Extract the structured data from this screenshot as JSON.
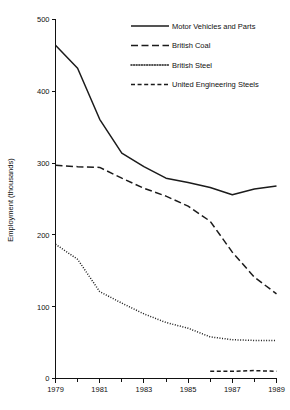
{
  "chart_data": {
    "type": "line",
    "title": "",
    "subtitle": "",
    "xlabel": "",
    "ylabel": "Employment (thousands)",
    "xlim": [
      1979,
      1989
    ],
    "ylim": [
      0,
      500
    ],
    "grid": false,
    "legend_position": "top-center",
    "y_ticks": [
      0,
      100,
      200,
      300,
      400,
      500
    ],
    "y_tick_labels": [
      "0",
      "100",
      "200",
      "300",
      "400",
      "500"
    ],
    "x_ticks": [
      1979,
      1980,
      1981,
      1982,
      1983,
      1984,
      1985,
      1986,
      1987,
      1988,
      1989
    ],
    "x_tick_labels_major": [
      "1979",
      "1981",
      "1983",
      "1985",
      "1987",
      "1989"
    ],
    "x_major_values": [
      1979,
      1981,
      1983,
      1985,
      1987,
      1989
    ],
    "x": [
      1979,
      1980,
      1981,
      1982,
      1983,
      1984,
      1985,
      1986,
      1987,
      1988,
      1989
    ],
    "series": [
      {
        "name": "Motor Vehicles and Parts",
        "style": "solid",
        "x": [
          1979,
          1980,
          1981,
          1982,
          1983,
          1984,
          1985,
          1986,
          1987,
          1988,
          1989
        ],
        "values": [
          464,
          432,
          361,
          314,
          295,
          279,
          273,
          266,
          256,
          264,
          268
        ]
      },
      {
        "name": "British Coal",
        "style": "long-dash",
        "x": [
          1979,
          1980,
          1981,
          1982,
          1983,
          1984,
          1985,
          1986,
          1987,
          1988,
          1989
        ],
        "values": [
          297,
          295,
          294,
          279,
          265,
          254,
          240,
          219,
          176,
          141,
          118
        ]
      },
      {
        "name": "British Steel",
        "style": "dotted",
        "x": [
          1979,
          1980,
          1981,
          1982,
          1983,
          1984,
          1985,
          1986,
          1987,
          1988,
          1989
        ],
        "values": [
          187,
          166,
          121,
          105,
          90,
          78,
          70,
          58,
          54,
          53,
          53
        ]
      },
      {
        "name": "United Engineering Steels",
        "style": "short-dash",
        "x": [
          1986,
          1987,
          1988,
          1989
        ],
        "values": [
          10,
          10,
          11,
          10
        ]
      }
    ]
  },
  "legend": {
    "entries": [
      {
        "label": "Motor Vehicles and Parts",
        "style": "solid"
      },
      {
        "label": "British Coal",
        "style": "long-dash"
      },
      {
        "label": "British Steel",
        "style": "dotted"
      },
      {
        "label": "United Engineering Steels",
        "style": "short-dash"
      }
    ]
  },
  "axes": {
    "y_axis_title": "Employment (thousands)",
    "y_labels": [
      "500",
      "400",
      "300",
      "200",
      "100",
      "0"
    ],
    "x_labels": [
      "1979",
      "1981",
      "1983",
      "1985",
      "1987",
      "1989"
    ]
  }
}
